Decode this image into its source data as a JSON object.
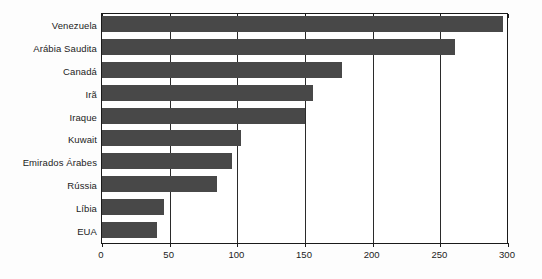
{
  "chart_data": {
    "type": "bar",
    "orientation": "horizontal",
    "title": "",
    "xlabel": "",
    "ylabel": "",
    "categories": [
      "Venezuela",
      "Arábia Saudita",
      "Canadá",
      "Irã",
      "Iraque",
      "Kuwait",
      "Emirados Árabes",
      "Rússia",
      "Líbia",
      "EUA"
    ],
    "values": [
      296,
      261,
      177,
      156,
      150,
      103,
      96,
      85,
      46,
      41
    ],
    "xlim": [
      0,
      300
    ],
    "xticks": [
      0,
      50,
      100,
      150,
      200,
      250,
      300
    ],
    "xtick_labels": [
      "0",
      "50",
      "100",
      "150",
      "200",
      "250",
      "300"
    ],
    "grid": "vertical",
    "legend": "none",
    "bar_color": "#484848",
    "axis_color": "#1a1a1a",
    "background_color": "#fdfdfd"
  }
}
